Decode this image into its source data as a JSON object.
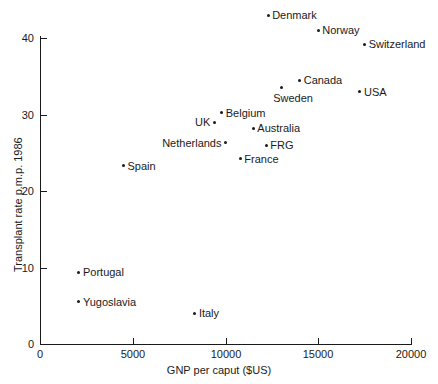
{
  "chart_data": {
    "type": "scatter",
    "title": "",
    "xlabel": "GNP per caput ($US)",
    "ylabel": "Transplant rate p.m.p. 1986",
    "xlim": [
      0,
      20000
    ],
    "ylim": [
      0,
      42
    ],
    "xticks": [
      0,
      5000,
      10000,
      15000,
      20000
    ],
    "xtick_labels": [
      "0",
      "5000",
      "10000",
      "15000",
      "20000"
    ],
    "yticks": [
      0,
      10,
      20,
      30,
      40
    ],
    "ytick_labels": [
      "0",
      "10",
      "20",
      "30",
      "40"
    ],
    "grid": false,
    "legend": "none",
    "points": [
      {
        "label": "Denmark",
        "x": 12300,
        "y": 43.0,
        "label_pos": "right"
      },
      {
        "label": "Norway",
        "x": 15000,
        "y": 41.0,
        "label_pos": "right"
      },
      {
        "label": "Switzerland",
        "x": 17500,
        "y": 39.2,
        "label_pos": "right"
      },
      {
        "label": "Canada",
        "x": 14000,
        "y": 34.5,
        "label_pos": "right"
      },
      {
        "label": "Sweden",
        "x": 13000,
        "y": 33.5,
        "label_pos": "below"
      },
      {
        "label": "USA",
        "x": 17250,
        "y": 33.0,
        "label_pos": "right"
      },
      {
        "label": "Belgium",
        "x": 9800,
        "y": 30.2,
        "label_pos": "right"
      },
      {
        "label": "UK",
        "x": 9400,
        "y": 29.0,
        "label_pos": "left"
      },
      {
        "label": "Australia",
        "x": 11500,
        "y": 28.2,
        "label_pos": "right"
      },
      {
        "label": "Netherlands",
        "x": 10000,
        "y": 26.3,
        "label_pos": "left"
      },
      {
        "label": "FRG",
        "x": 12200,
        "y": 26.0,
        "label_pos": "right"
      },
      {
        "label": "France",
        "x": 10800,
        "y": 24.2,
        "label_pos": "right"
      },
      {
        "label": "Spain",
        "x": 4500,
        "y": 23.3,
        "label_pos": "right"
      },
      {
        "label": "Portugal",
        "x": 2100,
        "y": 9.4,
        "label_pos": "right"
      },
      {
        "label": "Yugoslavia",
        "x": 2100,
        "y": 5.5,
        "label_pos": "right"
      },
      {
        "label": "Italy",
        "x": 8350,
        "y": 4.0,
        "label_pos": "right"
      }
    ]
  }
}
